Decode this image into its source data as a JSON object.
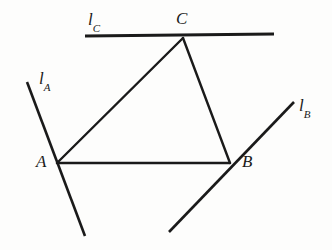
{
  "figure": {
    "background_color": "#fdfdfc",
    "stroke_color": "#1a1a1a"
  },
  "labels": {
    "line_a": {
      "base": "l",
      "subscript": "A"
    },
    "line_b": {
      "base": "l",
      "subscript": "B"
    },
    "line_c": {
      "base": "l",
      "subscript": "C"
    },
    "vertex_a": "A",
    "vertex_b": "B",
    "vertex_c": "C"
  },
  "geometry": {
    "vertices": {
      "A": {
        "x": 57,
        "y": 163
      },
      "B": {
        "x": 230,
        "y": 163
      },
      "C": {
        "x": 183,
        "y": 38
      }
    },
    "triangle_edges": [
      {
        "name": "edge-AB",
        "x1": 57,
        "y1": 163,
        "x2": 230,
        "y2": 163
      },
      {
        "name": "edge-AC",
        "x1": 57,
        "y1": 163,
        "x2": 183,
        "y2": 38
      },
      {
        "name": "edge-CB",
        "x1": 183,
        "y1": 38,
        "x2": 230,
        "y2": 163
      }
    ],
    "lines": [
      {
        "name": "line-lA",
        "through": "A",
        "x1": 27,
        "y1": 82,
        "x2": 85,
        "y2": 236
      },
      {
        "name": "line-lB",
        "through": "B",
        "x1": 169,
        "y1": 232,
        "x2": 294,
        "y2": 102
      },
      {
        "name": "line-lC",
        "through": "C",
        "x1": 85,
        "y1": 36,
        "x2": 274,
        "y2": 34
      }
    ],
    "stroke_widths": {
      "triangle": 2.4,
      "line_a": 2.6,
      "line_b": 2.6,
      "line_c": 3.2
    }
  }
}
